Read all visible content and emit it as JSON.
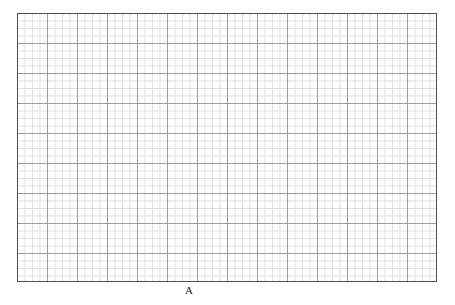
{
  "figure": {
    "background_color": "#ffffff",
    "width": 455,
    "height": 305
  },
  "plot": {
    "name": "blank-graph-paper-grid",
    "left": 17,
    "top": 13,
    "width": 420,
    "height": 269,
    "background_color": "#ffffff",
    "border_color": "#4f4f4f",
    "border_width": 1,
    "grid": {
      "major_color": "#9b9b9b",
      "minor_color": "#dedede",
      "major_spacing_x": 30,
      "major_spacing_y": 30,
      "minor_spacing_x": 7.5,
      "minor_spacing_y": 7.5,
      "major_line_width": 1,
      "minor_line_width": 1,
      "major_columns": 14,
      "major_rows": 9,
      "minor_columns": 56,
      "minor_rows": 36,
      "visible": true
    }
  },
  "labels": {
    "x_axis": {
      "text": "A",
      "center_x": 189,
      "top": 285,
      "font_size": 11,
      "color": "#1a1a1a"
    }
  },
  "chart_data": {
    "type": "scatter",
    "title": "",
    "subtitle": "",
    "xlabel": "A",
    "ylabel": "",
    "series": [],
    "categories": [],
    "values": [],
    "x": [],
    "xticklabels": [],
    "yticklabels": [],
    "xlim": [],
    "ylim": [],
    "grid": true,
    "legend": false,
    "legend_position": "none",
    "annotations": [],
    "note": "Empty plot area: graph-paper grid with no plotted data, no tick labels, only the x-axis label 'A'."
  }
}
